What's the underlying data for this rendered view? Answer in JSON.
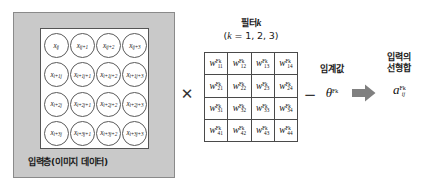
{
  "diagram": {
    "input_layer": {
      "caption": "입력층(이미지 데이터)",
      "cells": [
        {
          "base": "x",
          "sub": "ij"
        },
        {
          "base": "x",
          "sub": "ij+1"
        },
        {
          "base": "x",
          "sub": "ij+2"
        },
        {
          "base": "x",
          "sub": "ij+3"
        },
        {
          "base": "x",
          "sub": "i+1j"
        },
        {
          "base": "x",
          "sub": "i+1j+1"
        },
        {
          "base": "x",
          "sub": "i+1j+2"
        },
        {
          "base": "x",
          "sub": "i+1j+3"
        },
        {
          "base": "x",
          "sub": "i+2j"
        },
        {
          "base": "x",
          "sub": "i+2j+1"
        },
        {
          "base": "x",
          "sub": "i+2j+2"
        },
        {
          "base": "x",
          "sub": "i+2j+3"
        },
        {
          "base": "x",
          "sub": "i+3j"
        },
        {
          "base": "x",
          "sub": "i+3j+1"
        },
        {
          "base": "x",
          "sub": "i+3j+2"
        },
        {
          "base": "x",
          "sub": "i+3j+3"
        }
      ]
    },
    "multiply_symbol": "✕",
    "filter": {
      "title": "필터",
      "title_var": "k",
      "range_prefix": "(",
      "range_var": "k",
      "range_text": " = 1, 2,  3)",
      "cells": [
        {
          "base": "w",
          "sup": "Fk",
          "sub": "11"
        },
        {
          "base": "w",
          "sup": "Fk",
          "sub": "12"
        },
        {
          "base": "w",
          "sup": "Fk",
          "sub": "13"
        },
        {
          "base": "w",
          "sup": "Fk",
          "sub": "14"
        },
        {
          "base": "w",
          "sup": "Fk",
          "sub": "21"
        },
        {
          "base": "w",
          "sup": "Fk",
          "sub": "22"
        },
        {
          "base": "w",
          "sup": "Fk",
          "sub": "23"
        },
        {
          "base": "w",
          "sup": "Fk",
          "sub": "24"
        },
        {
          "base": "w",
          "sup": "Fk",
          "sub": "31"
        },
        {
          "base": "w",
          "sup": "Fk",
          "sub": "32"
        },
        {
          "base": "w",
          "sup": "Fk",
          "sub": "33"
        },
        {
          "base": "w",
          "sup": "Fk",
          "sub": "34"
        },
        {
          "base": "w",
          "sup": "Fk",
          "sub": "41"
        },
        {
          "base": "w",
          "sup": "Fk",
          "sub": "42"
        },
        {
          "base": "w",
          "sup": "Fk",
          "sub": "43"
        },
        {
          "base": "w",
          "sup": "Fk",
          "sub": "44"
        }
      ]
    },
    "minus_symbol": "−",
    "threshold": {
      "caption": "임계값",
      "symbol_base": "θ",
      "symbol_sup": "Fk"
    },
    "output": {
      "caption_line1": "입력의",
      "caption_line2": "선형합",
      "symbol_base": "a",
      "symbol_sup": "Fk",
      "symbol_sub": "ij"
    },
    "colors": {
      "input_box_fill": "#c9c9c9",
      "input_box_border": "#8a8a8a",
      "grid_border": "#555555",
      "circle_stroke": "#5a5a5a",
      "matrix_border": "#4a4a4a",
      "arrow_fill": "#808080",
      "text": "#1a1a1a"
    }
  }
}
